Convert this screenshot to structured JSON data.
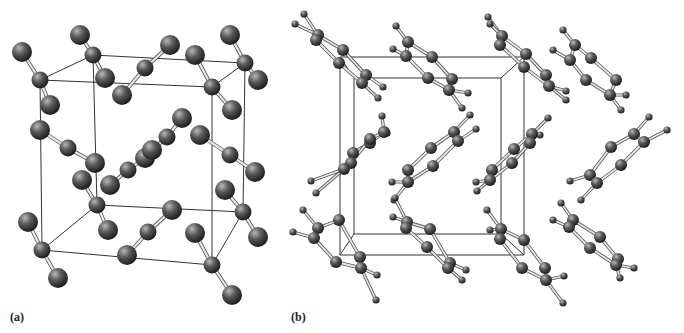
{
  "figure": {
    "panels": [
      {
        "label": "(a)",
        "structure": "linear triatomic molecular crystal (unit cell)",
        "cell": {
          "front": [
            [
              40,
              80
            ],
            [
              212,
              87
            ],
            [
              212,
              265
            ],
            [
              42,
              250
            ]
          ],
          "back": [
            [
              93,
              55
            ],
            [
              245,
              63
            ],
            [
              243,
              212
            ],
            [
              97,
              205
            ]
          ]
        },
        "molecules": [
          [
            [
              22,
              52
            ],
            [
              40,
              80
            ],
            [
              50,
              105
            ]
          ],
          [
            [
              80,
              35
            ],
            [
              93,
              55
            ],
            [
              105,
              78
            ]
          ],
          [
            [
              122,
              95
            ],
            [
              145,
              68
            ],
            [
              170,
              45
            ]
          ],
          [
            [
              195,
              55
            ],
            [
              212,
              87
            ],
            [
              232,
              110
            ]
          ],
          [
            [
              230,
              35
            ],
            [
              245,
              63
            ],
            [
              258,
              80
            ]
          ],
          [
            [
              40,
              130
            ],
            [
              68,
              148
            ],
            [
              95,
              163
            ]
          ],
          [
            [
              110,
              185
            ],
            [
              128,
              170
            ],
            [
              145,
              158
            ]
          ],
          [
            [
              152,
              150
            ],
            [
              167,
              137
            ],
            [
              182,
              118
            ]
          ],
          [
            [
              200,
              135
            ],
            [
              230,
              155
            ],
            [
              255,
              172
            ]
          ],
          [
            [
              82,
              180
            ],
            [
              97,
              205
            ],
            [
              108,
              230
            ]
          ],
          [
            [
              28,
              222
            ],
            [
              42,
              250
            ],
            [
              58,
              278
            ]
          ],
          [
            [
              127,
              255
            ],
            [
              148,
              232
            ],
            [
              172,
              210
            ]
          ],
          [
            [
              195,
              233
            ],
            [
              212,
              265
            ],
            [
              232,
              295
            ]
          ],
          [
            [
              225,
              190
            ],
            [
              243,
              212
            ],
            [
              258,
              237
            ]
          ]
        ]
      },
      {
        "label": "(b)",
        "structure": "aromatic ring molecular crystal (unit cell)",
        "cell": {
          "front": [
            [
              340,
              57
            ],
            [
              524,
              57
            ],
            [
              524,
              255
            ],
            [
              340,
              255
            ]
          ],
          "back": [
            [
              354,
              78
            ],
            [
              501,
              78
            ],
            [
              501,
              234
            ],
            [
              354,
              234
            ]
          ]
        },
        "rings": [
          {
            "c": [
              [
                318,
                35
              ],
              [
                343,
                50
              ],
              [
                366,
                75
              ],
              [
                362,
                83
              ],
              [
                339,
                63
              ],
              [
                316,
                40
              ]
            ],
            "h": [
              [
                304,
                14
              ],
              [
                295,
                24
              ],
              [
                383,
                87
              ],
              [
                378,
                98
              ]
            ]
          },
          {
            "c": [
              [
                408,
                42
              ],
              [
                432,
                57
              ],
              [
                452,
                79
              ],
              [
                449,
                90
              ],
              [
                428,
                78
              ],
              [
                406,
                56
              ]
            ],
            "h": [
              [
                396,
                26
              ],
              [
                393,
                49
              ],
              [
                468,
                93
              ],
              [
                462,
                108
              ]
            ]
          },
          {
            "c": [
              [
                502,
                36
              ],
              [
                526,
                54
              ],
              [
                546,
                75
              ],
              [
                549,
                86
              ],
              [
                524,
                67
              ],
              [
                500,
                45
              ]
            ],
            "h": [
              [
                488,
                17
              ],
              [
                490,
                24
              ],
              [
                566,
                91
              ],
              [
                566,
                100
              ]
            ]
          },
          {
            "c": [
              [
                575,
                45
              ],
              [
                591,
                58
              ],
              [
                616,
                80
              ],
              [
                610,
                95
              ],
              [
                586,
                80
              ],
              [
                570,
                60
              ]
            ],
            "h": [
              [
                563,
                30
              ],
              [
                553,
                50
              ],
              [
                626,
                95
              ],
              [
                621,
                110
              ]
            ]
          },
          {
            "c": [
              [
                353,
                153
              ],
              [
                370,
                143
              ],
              [
                384,
                132
              ],
              [
                370,
                139
              ],
              [
                351,
                163
              ],
              [
                344,
                169
              ]
            ],
            "h": [
              [
                382,
                116
              ],
              [
                387,
                133
              ],
              [
                311,
                181
              ],
              [
                316,
                193
              ]
            ]
          },
          {
            "c": [
              [
                408,
                170
              ],
              [
                431,
                148
              ],
              [
                454,
                132
              ],
              [
                458,
                141
              ],
              [
                433,
                166
              ],
              [
                408,
                182
              ]
            ],
            "h": [
              [
                470,
                115
              ],
              [
                476,
                129
              ],
              [
                392,
                182
              ],
              [
                394,
                200
              ]
            ]
          },
          {
            "c": [
              [
                492,
                170
              ],
              [
                514,
                149
              ],
              [
                532,
                134
              ],
              [
                530,
                143
              ],
              [
                512,
                163
              ],
              [
                490,
                180
              ]
            ],
            "h": [
              [
                548,
                118
              ],
              [
                540,
                135
              ],
              [
                476,
                182
              ],
              [
                477,
                191
              ]
            ]
          },
          {
            "c": [
              [
                590,
                175
              ],
              [
                611,
                147
              ],
              [
                634,
                134
              ],
              [
                644,
                142
              ],
              [
                621,
                165
              ],
              [
                597,
                183
              ]
            ],
            "h": [
              [
                649,
                117
              ],
              [
                667,
                130
              ],
              [
                570,
                181
              ],
              [
                581,
                200
              ]
            ]
          },
          {
            "c": [
              [
                318,
                228
              ],
              [
                339,
                220
              ],
              [
                360,
                257
              ],
              [
                361,
                268
              ],
              [
                336,
                262
              ],
              [
                314,
                238
              ]
            ],
            "h": [
              [
                303,
                210
              ],
              [
                293,
                232
              ],
              [
                377,
                275
              ],
              [
                376,
                300
              ]
            ]
          },
          {
            "c": [
              [
                407,
                222
              ],
              [
                430,
                229
              ],
              [
                450,
                263
              ],
              [
                448,
                268
              ],
              [
                427,
                247
              ],
              [
                406,
                228
              ]
            ],
            "h": [
              [
                395,
                198
              ],
              [
                393,
                217
              ],
              [
                466,
                270
              ],
              [
                462,
                280
              ]
            ]
          },
          {
            "c": [
              [
                501,
                229
              ],
              [
                524,
                240
              ],
              [
                545,
                268
              ],
              [
                546,
                280
              ],
              [
                522,
                268
              ],
              [
                500,
                239
              ]
            ],
            "h": [
              [
                487,
                210
              ],
              [
                490,
                230
              ],
              [
                564,
                276
              ],
              [
                563,
                303
              ]
            ]
          },
          {
            "c": [
              [
                573,
                220
              ],
              [
                600,
                237
              ],
              [
                618,
                259
              ],
              [
                616,
                265
              ],
              [
                590,
                248
              ],
              [
                569,
                227
              ]
            ],
            "h": [
              [
                561,
                203
              ],
              [
                553,
                220
              ],
              [
                634,
                268
              ],
              [
                620,
                278
              ]
            ]
          }
        ]
      }
    ]
  }
}
